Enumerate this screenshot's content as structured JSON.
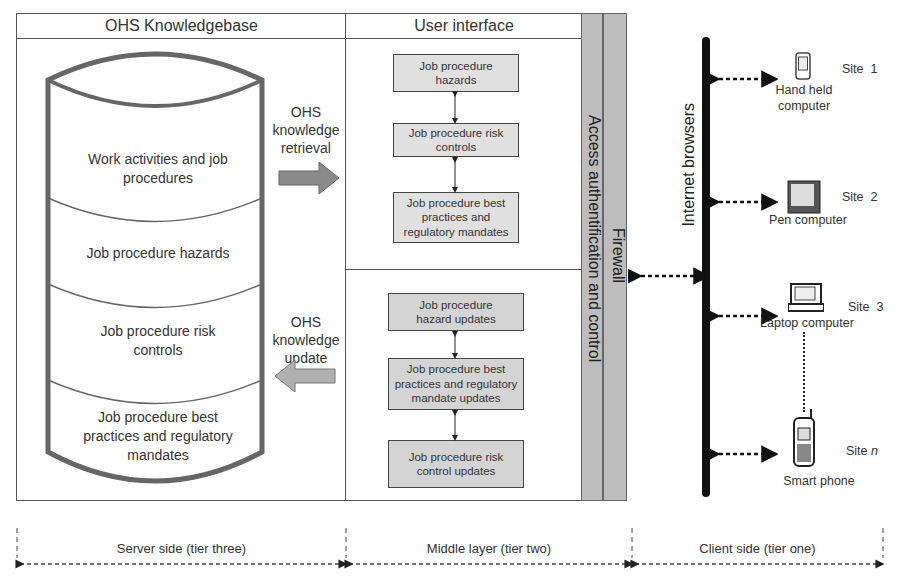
{
  "knowledgebase": {
    "title": "OHS Knowledgebase",
    "layers": [
      "Work activities and job procedures",
      "Job procedure hazards",
      "Job procedure risk controls",
      "Job procedure best practices and regulatory mandates"
    ]
  },
  "flows": {
    "retrieval": {
      "line1": "OHS",
      "line2": "knowledge",
      "line3": "retrieval"
    },
    "update": {
      "line1": "OHS",
      "line2": "knowledge",
      "line3": "update"
    }
  },
  "user_interface": {
    "title": "User interface",
    "retrieval_boxes": [
      "Job procedure hazards",
      "Job procedure risk controls",
      "Job procedure best practices and regulatory mandates"
    ],
    "update_boxes": [
      "Job procedure hazard updates",
      "Job procedure best practices and regulatory mandate updates",
      "Job procedure risk control updates"
    ]
  },
  "security": {
    "access": "Access authentification and control",
    "firewall": "Firewall"
  },
  "client": {
    "bus_label": "Internet browsers",
    "devices": [
      {
        "site": "Site  1",
        "name": "Hand held computer"
      },
      {
        "site": "Site  2",
        "name": "Pen computer"
      },
      {
        "site": "Site  3",
        "name": "Laptop computer"
      },
      {
        "site": "Site n",
        "name": "Smart phone"
      }
    ]
  },
  "tiers": [
    "Server side (tier three)",
    "Middle layer (tier two)",
    "Client side (tier one)"
  ],
  "colors": {
    "gray_bar": "#bdbdbd",
    "arrow_fill": "#8a8a8a",
    "box_fill": "#e0e0e0"
  }
}
